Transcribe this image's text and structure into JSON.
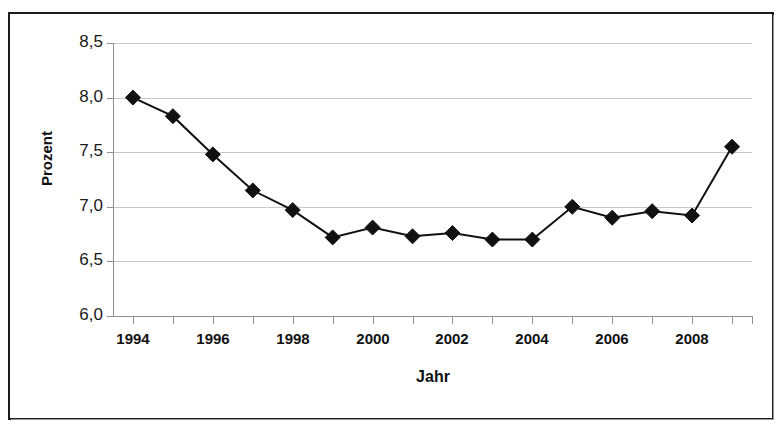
{
  "chart_data": {
    "type": "line",
    "title": "",
    "xlabel": "Jahr",
    "ylabel": "Prozent",
    "x": [
      1994,
      1995,
      1996,
      1997,
      1998,
      1999,
      2000,
      2001,
      2002,
      2003,
      2004,
      2005,
      2006,
      2007,
      2008,
      2009
    ],
    "values": [
      8.0,
      7.83,
      7.48,
      7.15,
      6.97,
      6.72,
      6.81,
      6.73,
      6.76,
      6.7,
      6.7,
      7.0,
      6.9,
      6.96,
      6.92,
      7.55
    ],
    "series": [
      {
        "name": "Prozent",
        "values": [
          8.0,
          7.83,
          7.48,
          7.15,
          6.97,
          6.72,
          6.81,
          6.73,
          6.76,
          6.7,
          6.7,
          7.0,
          6.9,
          6.96,
          6.92,
          7.55
        ]
      }
    ],
    "xlim": [
      1993.5,
      2009.5
    ],
    "ylim": [
      6.0,
      8.5
    ],
    "ytick_labels": [
      "8,5",
      "8,0",
      "7,5",
      "7,0",
      "6,5",
      "6,0"
    ],
    "ytick_values": [
      8.5,
      8.0,
      7.5,
      7.0,
      6.5,
      6.0
    ],
    "xtick_labels": [
      "1994",
      "1996",
      "1998",
      "2000",
      "2002",
      "2004",
      "2006",
      "2008"
    ],
    "xtick_values": [
      1994,
      1996,
      1998,
      2000,
      2002,
      2004,
      2006,
      2008
    ],
    "grid": true,
    "legend": "none",
    "marker": "diamond",
    "marker_color": "#111111",
    "line_color": "#111111",
    "grid_color": "#c9c9c9",
    "background": "#ffffff",
    "border_color": "#1c1c1c"
  }
}
